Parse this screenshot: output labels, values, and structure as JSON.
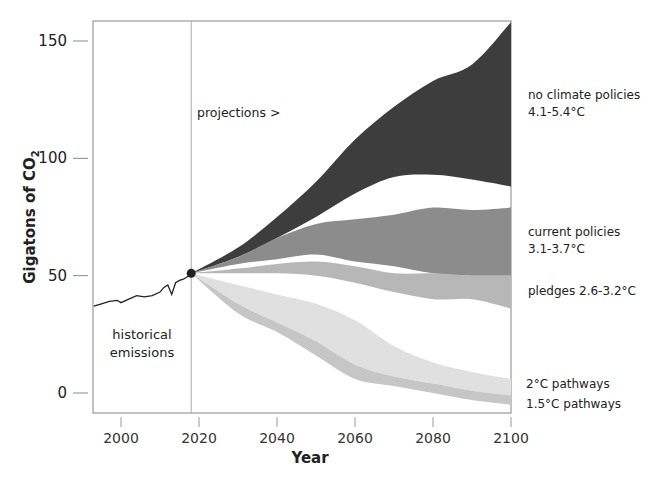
{
  "chart_data": {
    "type": "area",
    "title": "",
    "xlabel": "Year",
    "ylabel": "Gigatons of CO2",
    "xlim": [
      1993,
      2100
    ],
    "ylim": [
      -8,
      158
    ],
    "x_ticks": [
      2000,
      2020,
      2040,
      2060,
      2080,
      2100
    ],
    "y_ticks": [
      0,
      50,
      100,
      150
    ],
    "grid": false,
    "legend_position": "right (direct labels)",
    "historical": {
      "name": "historical emissions",
      "x": [
        1993,
        1995,
        1997,
        1999,
        2000,
        2002,
        2004,
        2006,
        2008,
        2010,
        2011,
        2012,
        2013,
        2014,
        2015,
        2016,
        2017,
        2018
      ],
      "y": [
        37,
        38,
        39,
        39.5,
        38.5,
        40,
        41.5,
        41,
        41.5,
        43,
        45,
        46,
        42,
        47,
        48,
        48.5,
        49.5,
        51
      ]
    },
    "projection_start": {
      "year": 2018,
      "value": 51
    },
    "divider_year": 2018,
    "series": [
      {
        "name": "no climate policies",
        "label": "no climate policies 4.1-5.4°C",
        "color": "#3d3d3d",
        "x": [
          2018,
          2030,
          2040,
          2050,
          2060,
          2070,
          2080,
          2090,
          2100
        ],
        "upper": [
          51,
          62,
          75,
          90,
          108,
          122,
          133,
          140,
          158
        ],
        "lower": [
          51,
          58,
          66,
          75,
          85,
          92,
          93,
          91,
          88
        ]
      },
      {
        "name": "current policies",
        "label": "current policies 3.1-3.7°C",
        "color": "#8c8c8c",
        "x": [
          2018,
          2030,
          2040,
          2050,
          2060,
          2070,
          2080,
          2090,
          2100
        ],
        "upper": [
          51,
          58,
          66,
          72,
          74,
          76,
          79,
          78,
          79
        ],
        "lower": [
          51,
          55,
          57,
          59,
          56,
          54,
          51,
          50,
          50
        ]
      },
      {
        "name": "pledges",
        "label": "pledges 2.6-3.2°C",
        "color": "#b7b7b7",
        "x": [
          2018,
          2030,
          2040,
          2050,
          2060,
          2070,
          2080,
          2090,
          2100
        ],
        "upper": [
          51,
          53,
          55,
          56,
          54,
          51,
          51,
          50,
          50
        ],
        "lower": [
          51,
          51,
          51,
          50,
          47,
          43,
          40,
          40,
          36
        ]
      },
      {
        "name": "2°C pathways",
        "label": "2°C pathways",
        "color": "#e0e0e0",
        "x": [
          2018,
          2030,
          2040,
          2050,
          2060,
          2070,
          2080,
          2090,
          2100
        ],
        "upper": [
          51,
          46,
          42,
          38,
          31,
          20,
          13,
          9,
          6
        ],
        "lower": [
          51,
          38,
          30,
          22,
          12,
          7,
          4,
          1,
          -1
        ]
      },
      {
        "name": "1.5°C pathways",
        "label": "1.5°C pathways",
        "color": "#c6c6c6",
        "x": [
          2018,
          2030,
          2040,
          2050,
          2060,
          2070,
          2080,
          2090,
          2100
        ],
        "upper": [
          51,
          38,
          30,
          22,
          12,
          7,
          4,
          1,
          -1
        ],
        "lower": [
          51,
          34,
          26,
          16,
          6,
          3,
          0,
          -3,
          -5
        ]
      }
    ],
    "annotations": {
      "historical": [
        "historical",
        "emissions"
      ],
      "projections": "projections  >"
    }
  },
  "labels": {
    "title_fragment": "",
    "ylabel_main": "Gigatons of CO",
    "ylabel_sub": "2",
    "xlabel": "Year",
    "historical_line1": "historical",
    "historical_line2": "emissions",
    "projections": "projections  >",
    "no_policy_line1": "no climate policies",
    "no_policy_line2": "4.1-5.4°C",
    "current_line1": "current policies",
    "current_line2": "3.1-3.7°C",
    "pledges": "pledges 2.6-3.2°C",
    "two_c": "2°C pathways",
    "one_five_c": "1.5°C pathways",
    "x_ticks": [
      "2000",
      "2020",
      "2040",
      "2060",
      "2080",
      "2100"
    ],
    "y_ticks": [
      "0",
      "50",
      "100",
      "150"
    ]
  },
  "colors": {
    "axis": "#9a9a9a",
    "no_policy": "#3d3d3d",
    "current": "#8c8c8c",
    "pledges": "#b7b7b7",
    "two_c": "#e0e0e0",
    "one_five_c": "#c6c6c6",
    "marker": "#222222"
  }
}
